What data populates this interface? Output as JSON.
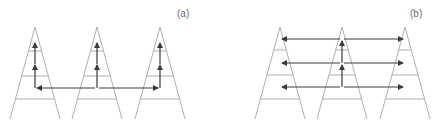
{
  "panels": [
    {
      "label": "(a)",
      "label_pos": [
        177,
        8
      ],
      "triangles": [
        {
          "apex": [
            35,
            27
          ],
          "base_y": 119,
          "half_width": 25
        },
        {
          "apex": [
            97,
            27
          ],
          "base_y": 119,
          "half_width": 25
        },
        {
          "apex": [
            160,
            27
          ],
          "base_y": 119,
          "half_width": 25
        }
      ],
      "rungs_y": [
        51,
        76,
        99
      ],
      "arrows": [
        {
          "from": [
            35,
            64
          ],
          "to": [
            35,
            43
          ]
        },
        {
          "from": [
            35,
            88
          ],
          "to": [
            35,
            65
          ]
        },
        {
          "from": [
            97,
            64
          ],
          "to": [
            97,
            43
          ]
        },
        {
          "from": [
            97,
            88
          ],
          "to": [
            97,
            65
          ]
        },
        {
          "from": [
            160,
            64
          ],
          "to": [
            160,
            43
          ]
        },
        {
          "from": [
            160,
            88
          ],
          "to": [
            160,
            65
          ]
        },
        {
          "from": [
            95,
            88
          ],
          "to": [
            37,
            88
          ]
        },
        {
          "from": [
            99,
            88
          ],
          "to": [
            158,
            88
          ]
        }
      ],
      "lines": [
        {
          "from": [
            160,
            88
          ],
          "to": [
            160,
            88
          ]
        }
      ]
    },
    {
      "label": "(b)",
      "label_pos": [
        410,
        8
      ],
      "triangles": [
        {
          "apex": [
            280,
            27
          ],
          "base_y": 119,
          "half_width": 25
        },
        {
          "apex": [
            342,
            27
          ],
          "base_y": 119,
          "half_width": 25
        },
        {
          "apex": [
            405,
            27
          ],
          "base_y": 119,
          "half_width": 25
        }
      ],
      "rungs_y": [
        50,
        75,
        99
      ],
      "arrows": [
        {
          "from": [
            340,
            39
          ],
          "to": [
            282,
            39
          ]
        },
        {
          "from": [
            344,
            39
          ],
          "to": [
            403,
            39
          ]
        },
        {
          "from": [
            340,
            63
          ],
          "to": [
            282,
            63
          ]
        },
        {
          "from": [
            344,
            63
          ],
          "to": [
            403,
            63
          ]
        },
        {
          "from": [
            340,
            87
          ],
          "to": [
            282,
            87
          ]
        },
        {
          "from": [
            344,
            87
          ],
          "to": [
            403,
            87
          ]
        },
        {
          "from": [
            342,
            63
          ],
          "to": [
            342,
            41
          ]
        },
        {
          "from": [
            342,
            87
          ],
          "to": [
            342,
            65
          ]
        }
      ]
    }
  ],
  "colors": {
    "outline": "#9a9a9a",
    "arrow": "#3a3a3a",
    "label": "#6a6a6a"
  }
}
